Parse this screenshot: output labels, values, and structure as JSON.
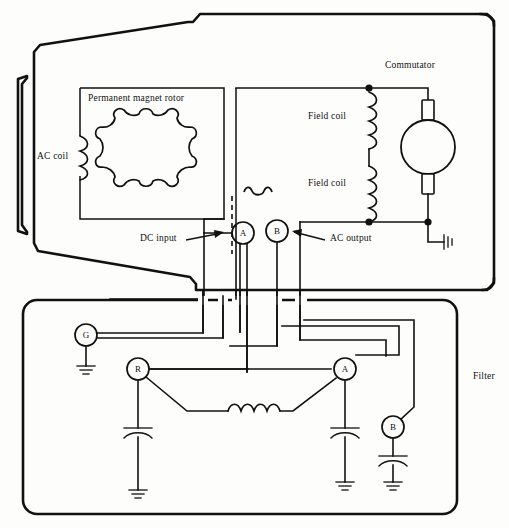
{
  "diagram": {
    "stroke_color": "#111111",
    "background_color": "#fdfdfb"
  },
  "labels": {
    "permanent_magnet_rotor": "Permanent magnet rotor",
    "ac_coil": "AC coil",
    "commutator": "Commutator",
    "field_coil_upper": "Field coil",
    "field_coil_lower": "Field coil",
    "dc_input": "DC input",
    "ac_output": "AC output",
    "filter": "Filter"
  },
  "connector": {
    "pin_a": "A",
    "pin_b": "B"
  },
  "filter_terminals": {
    "ground": "G",
    "regulator": "R",
    "armature": "A",
    "battery": "B"
  },
  "components": {
    "ac_coil_symbol": "coil",
    "field_coil_symbol": "coil",
    "rotor_symbol": "lobed-rotor",
    "commutator_symbol": "circle-with-brushes",
    "inductor_symbol": "coil",
    "capacitor_symbol": "curved-plate-capacitor",
    "ground_symbol": "earth-ground"
  }
}
